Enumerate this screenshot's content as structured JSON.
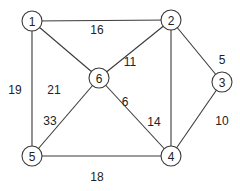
{
  "graph": {
    "nodes": [
      {
        "id": "1",
        "label": "1",
        "x": 32,
        "y": 21
      },
      {
        "id": "2",
        "label": "2",
        "x": 171,
        "y": 20
      },
      {
        "id": "3",
        "label": "3",
        "x": 222,
        "y": 82
      },
      {
        "id": "4",
        "label": "4",
        "x": 171,
        "y": 156
      },
      {
        "id": "5",
        "label": "5",
        "x": 32,
        "y": 156
      },
      {
        "id": "6",
        "label": "6",
        "x": 99,
        "y": 78
      }
    ],
    "edges": [
      {
        "from": "1",
        "to": "2",
        "weight": "16",
        "lx": 97,
        "ly": 30
      },
      {
        "from": "1",
        "to": "5",
        "weight": "19",
        "lx": 15,
        "ly": 90
      },
      {
        "from": "1",
        "to": "6",
        "weight": "21",
        "lx": 54,
        "ly": 90
      },
      {
        "from": "2",
        "to": "6",
        "weight": "11",
        "lx": 130,
        "ly": 62
      },
      {
        "from": "2",
        "to": "3",
        "weight": "5",
        "lx": 222,
        "ly": 60
      },
      {
        "from": "2",
        "to": "4",
        "weight": "14",
        "lx": 154,
        "ly": 122
      },
      {
        "from": "6",
        "to": "4",
        "weight": "6",
        "lx": 125,
        "ly": 102
      },
      {
        "from": "3",
        "to": "4",
        "weight": "10",
        "lx": 222,
        "ly": 121
      },
      {
        "from": "6",
        "to": "5",
        "weight": "33",
        "lx": 50,
        "ly": 121
      },
      {
        "from": "5",
        "to": "4",
        "weight": "18",
        "lx": 97,
        "ly": 177
      }
    ]
  }
}
